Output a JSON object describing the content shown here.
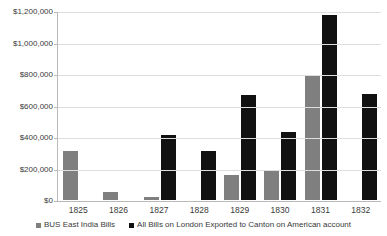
{
  "chart_data": {
    "type": "bar",
    "title": "",
    "subtitle": "",
    "xlabel": "",
    "ylabel": "",
    "categories": [
      "1825",
      "1826",
      "1827",
      "1828",
      "1829",
      "1830",
      "1831",
      "1832"
    ],
    "series": [
      {
        "name": "BUS East India Bills",
        "color": "#7f7f7f",
        "values": [
          310000,
          50000,
          20000,
          0,
          160000,
          190000,
          790000,
          0
        ]
      },
      {
        "name": "All Bills on London Exported to Canton on American account",
        "color": "#111111",
        "values": [
          0,
          0,
          410000,
          310000,
          665000,
          430000,
          1175000,
          675000
        ]
      }
    ],
    "ylim": [
      0,
      1200000
    ],
    "ytick_values": [
      0,
      200000,
      400000,
      600000,
      800000,
      1000000,
      1200000
    ],
    "ytick_labels": [
      "$0",
      "$200,000",
      "$400,000",
      "$600,000",
      "$800,000",
      "$1,000,000",
      "$1,200,000"
    ],
    "grid": true,
    "grid_axis": "y",
    "legend_position": "bottom",
    "colors": {
      "series_0": "#7f7f7f",
      "series_1": "#111111",
      "gridline": "#dedede",
      "axis": "#b9b9b9",
      "text": "#3a3a3a",
      "background": "#ffffff"
    }
  }
}
